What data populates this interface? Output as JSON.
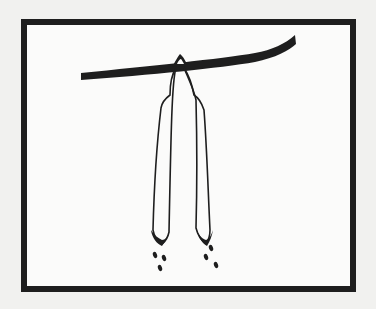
{
  "illustration": {
    "subject": "seed pods hanging from a branch releasing seeds",
    "colors": {
      "background": "#f1f1ef",
      "panel": "#fbfbfa",
      "ink": "#1e1e1e"
    },
    "frame": {
      "x": 21,
      "y": 19,
      "width": 335,
      "height": 273,
      "stroke_width": 6
    },
    "pod_count": 2,
    "seeds_per_pod": 3
  }
}
